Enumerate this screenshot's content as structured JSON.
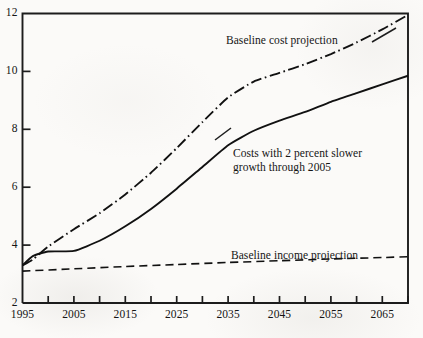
{
  "chart_data": {
    "type": "line",
    "title": "",
    "subtitle": "",
    "xlabel": "",
    "ylabel": "",
    "xlim": [
      1995,
      2070
    ],
    "ylim": [
      2,
      12
    ],
    "grid": false,
    "legend_position": "inline-annotations",
    "y_ticks": [
      2,
      4,
      6,
      8,
      10,
      12
    ],
    "y_tick_labels": [
      "2",
      "4",
      "6",
      "8",
      "10",
      "12"
    ],
    "x_ticks": [
      1995,
      2000,
      2005,
      2010,
      2015,
      2020,
      2025,
      2030,
      2035,
      2040,
      2045,
      2050,
      2055,
      2060,
      2065,
      2070
    ],
    "x_tick_labels": [
      "1995",
      "",
      "2005",
      "",
      "2015",
      "",
      "2025",
      "",
      "2035",
      "",
      "2045",
      "",
      "2055",
      "",
      "2065",
      ""
    ],
    "x_labeled_ticks": [
      {
        "value": 1995,
        "label": "1995"
      },
      {
        "value": 2005,
        "label": "2005"
      },
      {
        "value": 2015,
        "label": "2015"
      },
      {
        "value": 2025,
        "label": "2025"
      },
      {
        "value": 2035,
        "label": "2035"
      },
      {
        "value": 2045,
        "label": "2045"
      },
      {
        "value": 2055,
        "label": "2055"
      },
      {
        "value": 2065,
        "label": "2065"
      }
    ],
    "series": [
      {
        "name": "Baseline cost projection",
        "style": "dash-dot",
        "color": "#111111",
        "x": [
          1995,
          1997,
          2000,
          2005,
          2010,
          2015,
          2020,
          2025,
          2030,
          2035,
          2040,
          2045,
          2050,
          2055,
          2060,
          2065,
          2070
        ],
        "values": [
          3.3,
          3.5,
          3.95,
          4.55,
          5.1,
          5.75,
          6.5,
          7.35,
          8.25,
          9.1,
          9.65,
          9.95,
          10.25,
          10.6,
          11.0,
          11.45,
          11.95
        ]
      },
      {
        "name": "Costs with 2 percent slower growth through 2005",
        "style": "solid",
        "color": "#111111",
        "x": [
          1995,
          1997,
          2000,
          2005,
          2010,
          2015,
          2020,
          2025,
          2030,
          2035,
          2040,
          2045,
          2050,
          2055,
          2060,
          2065,
          2070
        ],
        "values": [
          3.3,
          3.62,
          3.78,
          3.8,
          4.15,
          4.65,
          5.25,
          5.95,
          6.7,
          7.45,
          7.95,
          8.3,
          8.6,
          8.95,
          9.25,
          9.55,
          9.85
        ]
      },
      {
        "name": "Baseline income projection",
        "style": "dashed",
        "color": "#111111",
        "x": [
          1995,
          2005,
          2015,
          2025,
          2035,
          2045,
          2055,
          2065,
          2070
        ],
        "values": [
          3.1,
          3.18,
          3.26,
          3.33,
          3.4,
          3.46,
          3.52,
          3.57,
          3.6
        ]
      }
    ],
    "annotations": [
      {
        "text": "Baseline cost projection",
        "x_px": 226,
        "y_px": 34,
        "series": "Baseline cost projection"
      },
      {
        "text": "Costs with 2 percent slower",
        "x_px": 233,
        "y_px": 147,
        "series": "Costs with 2 percent slower growth through 2005"
      },
      {
        "text": "growth through 2005",
        "x_px": 233,
        "y_px": 161,
        "series": "Costs with 2 percent slower growth through 2005"
      },
      {
        "text": "Baseline income projection",
        "x_px": 231,
        "y_px": 249,
        "series": "Baseline income projection"
      }
    ]
  }
}
